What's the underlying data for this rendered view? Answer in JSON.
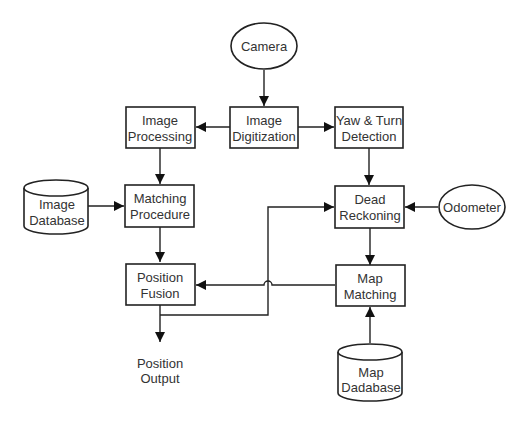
{
  "diagram": {
    "type": "block-diagram",
    "nodes": {
      "camera": {
        "shape": "ellipse",
        "lines": [
          "Camera"
        ]
      },
      "image_digitization": {
        "shape": "box",
        "lines": [
          "Image",
          "Digitization"
        ]
      },
      "image_processing": {
        "shape": "box",
        "lines": [
          "Image",
          "Processing"
        ]
      },
      "yaw_turn_detection": {
        "shape": "box",
        "lines": [
          "Yaw & Turn",
          "Detection"
        ]
      },
      "image_database": {
        "shape": "cylinder",
        "lines": [
          "Image",
          "Database"
        ]
      },
      "matching_procedure": {
        "shape": "box",
        "lines": [
          "Matching",
          "Procedure"
        ]
      },
      "dead_reckoning": {
        "shape": "box",
        "lines": [
          "Dead",
          "Reckoning"
        ]
      },
      "odometer": {
        "shape": "ellipse",
        "lines": [
          "Odometer"
        ]
      },
      "position_fusion": {
        "shape": "box",
        "lines": [
          "Position",
          "Fusion"
        ]
      },
      "map_matching": {
        "shape": "box",
        "lines": [
          "Map",
          "Matching"
        ]
      },
      "position_output": {
        "shape": "text",
        "lines": [
          "Position",
          "Output"
        ]
      },
      "map_database": {
        "shape": "cylinder",
        "lines": [
          "Map",
          "Dadabase"
        ]
      }
    },
    "edges": [
      {
        "from": "Camera",
        "to": "Image Digitization"
      },
      {
        "from": "Image Digitization",
        "to": "Image Processing"
      },
      {
        "from": "Image Digitization",
        "to": "Yaw & Turn Detection"
      },
      {
        "from": "Image Processing",
        "to": "Matching Procedure"
      },
      {
        "from": "Image Database",
        "to": "Matching Procedure"
      },
      {
        "from": "Matching Procedure",
        "to": "Position Fusion"
      },
      {
        "from": "Yaw & Turn Detection",
        "to": "Dead Reckoning"
      },
      {
        "from": "Odometer",
        "to": "Dead Reckoning"
      },
      {
        "from": "Dead Reckoning",
        "to": "Map Matching"
      },
      {
        "from": "Map Matching",
        "to": "Position Fusion"
      },
      {
        "from": "Map Dadabase",
        "to": "Map Matching"
      },
      {
        "from": "Position Fusion",
        "to": "Position Output"
      },
      {
        "from": "Position Fusion",
        "to": "Dead Reckoning",
        "note": "feedback line with hop-over crossing"
      }
    ]
  }
}
